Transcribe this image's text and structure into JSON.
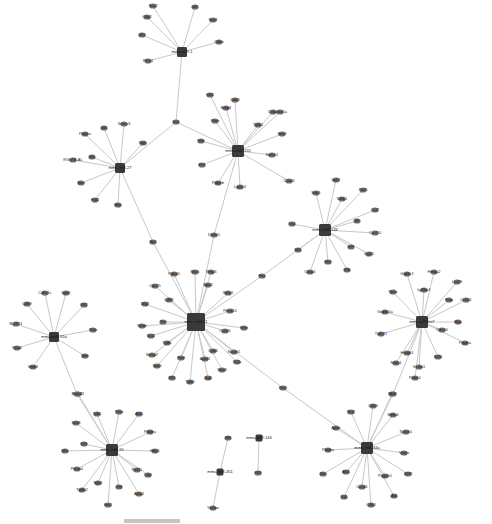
{
  "diagram": {
    "type": "gene-interaction-network",
    "hubs": [
      {
        "id": "h1",
        "label": "mmu-miR-1",
        "x": 182,
        "y": 52,
        "size": 10,
        "leaves": [
          {
            "label": "Sox2",
            "x": 153,
            "y": 6
          },
          {
            "label": "Id2",
            "x": 195,
            "y": 7
          },
          {
            "label": "Sox1",
            "x": 213,
            "y": 20
          },
          {
            "label": "Olig2",
            "x": 147,
            "y": 17
          },
          {
            "label": "Gli3",
            "x": 142,
            "y": 35
          },
          {
            "label": "Cdon",
            "x": 219,
            "y": 42
          },
          {
            "label": "Ptch1",
            "x": 148,
            "y": 61
          }
        ]
      },
      {
        "id": "h2",
        "label": "mmu-miR-27",
        "x": 120,
        "y": 168,
        "size": 10,
        "leaves": [
          {
            "label": "Pdgfra",
            "x": 85,
            "y": 134
          },
          {
            "label": "Id4",
            "x": 104,
            "y": 128
          },
          {
            "label": "Sema3",
            "x": 124,
            "y": 124
          },
          {
            "label": "Ngfr",
            "x": 143,
            "y": 143
          },
          {
            "label": "RG67B-AL",
            "x": 73,
            "y": 160
          },
          {
            "label": "Id1",
            "x": 92,
            "y": 157
          },
          {
            "label": "Nes",
            "x": 81,
            "y": 183
          },
          {
            "label": "Fgf2",
            "x": 95,
            "y": 200
          },
          {
            "label": "Myc",
            "x": 118,
            "y": 205
          }
        ]
      },
      {
        "id": "h3",
        "label": "mmu-miR-155",
        "x": 238,
        "y": 151,
        "size": 12,
        "leaves": [
          {
            "label": "Klf4",
            "x": 210,
            "y": 95
          },
          {
            "label": "Cd44",
            "x": 235,
            "y": 100
          },
          {
            "label": "Bmp4",
            "x": 226,
            "y": 108
          },
          {
            "label": "Cxcr4",
            "x": 273,
            "y": 112
          },
          {
            "label": "Cdkn1a",
            "x": 280,
            "y": 112
          },
          {
            "label": "Pten",
            "x": 215,
            "y": 121
          },
          {
            "label": "Tgfb1",
            "x": 258,
            "y": 125
          },
          {
            "label": "Sox9",
            "x": 282,
            "y": 134
          },
          {
            "label": "Vim",
            "x": 201,
            "y": 141
          },
          {
            "label": "Notch1",
            "x": 272,
            "y": 155
          },
          {
            "label": "Fn1",
            "x": 202,
            "y": 165
          },
          {
            "label": "Pdgfrb",
            "x": 218,
            "y": 183
          },
          {
            "label": "Lgals3",
            "x": 240,
            "y": 187
          },
          {
            "label": "Ccnd1",
            "x": 289,
            "y": 181
          }
        ]
      },
      {
        "id": "h4",
        "label": "mmu-miR-146",
        "x": 325,
        "y": 230,
        "size": 12,
        "leaves": [
          {
            "label": "Irak1",
            "x": 336,
            "y": 180
          },
          {
            "label": "Traf6",
            "x": 363,
            "y": 190
          },
          {
            "label": "Stat1",
            "x": 316,
            "y": 193
          },
          {
            "label": "Nfkb1",
            "x": 342,
            "y": 199
          },
          {
            "label": "Ccl2",
            "x": 375,
            "y": 210
          },
          {
            "label": "Il6",
            "x": 357,
            "y": 221
          },
          {
            "label": "Tlr4",
            "x": 292,
            "y": 224
          },
          {
            "label": "Cxcl10",
            "x": 375,
            "y": 233
          },
          {
            "label": "Ifit1",
            "x": 298,
            "y": 250
          },
          {
            "label": "Irf7",
            "x": 351,
            "y": 247
          },
          {
            "label": "Isg15",
            "x": 369,
            "y": 254
          },
          {
            "label": "Mx1",
            "x": 328,
            "y": 262
          },
          {
            "label": "Casp1",
            "x": 310,
            "y": 272
          },
          {
            "label": "Il1b",
            "x": 347,
            "y": 270
          }
        ]
      },
      {
        "id": "h5",
        "label": "mmu-miR-21",
        "x": 196,
        "y": 322,
        "size": 18,
        "leaves": [
          {
            "label": "Pdcd4",
            "x": 174,
            "y": 274
          },
          {
            "label": "Reck",
            "x": 195,
            "y": 272
          },
          {
            "label": "Timp3",
            "x": 211,
            "y": 272
          },
          {
            "label": "Sprr2",
            "x": 208,
            "y": 285
          },
          {
            "label": "Cdc25",
            "x": 155,
            "y": 286
          },
          {
            "label": "Spry1",
            "x": 228,
            "y": 293
          },
          {
            "label": "Cdh1",
            "x": 169,
            "y": 300
          },
          {
            "label": "Btg2",
            "x": 145,
            "y": 304
          },
          {
            "label": "Rhob",
            "x": 142,
            "y": 326
          },
          {
            "label": "Tnc",
            "x": 163,
            "y": 322
          },
          {
            "label": "Pdcd10",
            "x": 230,
            "y": 311
          },
          {
            "label": "Pten",
            "x": 244,
            "y": 328
          },
          {
            "label": "Ccnd1",
            "x": 225,
            "y": 331
          },
          {
            "label": "Bcl2",
            "x": 151,
            "y": 336
          },
          {
            "label": "Tgfbi",
            "x": 167,
            "y": 343
          },
          {
            "label": "Smad7",
            "x": 152,
            "y": 355
          },
          {
            "label": "Fasl",
            "x": 181,
            "y": 358
          },
          {
            "label": "Apaf1",
            "x": 205,
            "y": 359
          },
          {
            "label": "Cdk6",
            "x": 213,
            "y": 351
          },
          {
            "label": "Ncam1",
            "x": 234,
            "y": 352
          },
          {
            "label": "Il12a",
            "x": 237,
            "y": 362
          },
          {
            "label": "Sox5",
            "x": 157,
            "y": 366
          },
          {
            "label": "Klf5",
            "x": 172,
            "y": 378
          },
          {
            "label": "Tp63",
            "x": 190,
            "y": 382
          },
          {
            "label": "Jag1",
            "x": 208,
            "y": 378
          },
          {
            "label": "Stat3",
            "x": 222,
            "y": 370
          }
        ]
      },
      {
        "id": "h6",
        "label": "mmu-miR-let7",
        "x": 422,
        "y": 322,
        "size": 12,
        "leaves": [
          {
            "label": "Gabbr1",
            "x": 407,
            "y": 274
          },
          {
            "label": "Hmga2",
            "x": 434,
            "y": 272
          },
          {
            "label": "Lin28",
            "x": 457,
            "y": 282
          },
          {
            "label": "Igf2bp1",
            "x": 424,
            "y": 290
          },
          {
            "label": "Nras",
            "x": 393,
            "y": 292
          },
          {
            "label": "Kras",
            "x": 449,
            "y": 300
          },
          {
            "label": "Ccnd1",
            "x": 466,
            "y": 300
          },
          {
            "label": "Gabbr2a",
            "x": 385,
            "y": 312
          },
          {
            "label": "Myc",
            "x": 458,
            "y": 322
          },
          {
            "label": "Cdc34",
            "x": 442,
            "y": 330
          },
          {
            "label": "Pdgfra",
            "x": 465,
            "y": 343
          },
          {
            "label": "Trim71",
            "x": 381,
            "y": 334
          },
          {
            "label": "Hmgb1",
            "x": 407,
            "y": 353
          },
          {
            "label": "E2f5",
            "x": 438,
            "y": 357
          },
          {
            "label": "Nr6a1",
            "x": 396,
            "y": 363
          },
          {
            "label": "Vcam1",
            "x": 419,
            "y": 367
          },
          {
            "label": "Prdm1",
            "x": 415,
            "y": 378
          }
        ]
      },
      {
        "id": "h7",
        "label": "mmu-miR-92a",
        "x": 54,
        "y": 337,
        "size": 10,
        "leaves": [
          {
            "label": "Cdkn1c",
            "x": 45,
            "y": 293
          },
          {
            "label": "Itga5",
            "x": 66,
            "y": 293
          },
          {
            "label": "Cd69",
            "x": 27,
            "y": 304
          },
          {
            "label": "Klf2",
            "x": 84,
            "y": 305
          },
          {
            "label": "Bcl2l11",
            "x": 16,
            "y": 324
          },
          {
            "label": "Pten",
            "x": 93,
            "y": 330
          },
          {
            "label": "Nox4",
            "x": 17,
            "y": 348
          },
          {
            "label": "Bim",
            "x": 85,
            "y": 356
          },
          {
            "label": "Mob3",
            "x": 33,
            "y": 367
          }
        ]
      },
      {
        "id": "h8",
        "label": "mmu-miR-19",
        "x": 112,
        "y": 450,
        "size": 12,
        "leaves": [
          {
            "label": "Rab23",
            "x": 78,
            "y": 394
          },
          {
            "label": "Tab1",
            "x": 97,
            "y": 414
          },
          {
            "label": "Pten",
            "x": 119,
            "y": 412
          },
          {
            "label": "Akt1",
            "x": 139,
            "y": 414
          },
          {
            "label": "Sox8",
            "x": 76,
            "y": 423
          },
          {
            "label": "Pdgfra",
            "x": 150,
            "y": 432
          },
          {
            "label": "Kif1",
            "x": 84,
            "y": 444
          },
          {
            "label": "Nfia",
            "x": 65,
            "y": 451
          },
          {
            "label": "Hbp1",
            "x": 155,
            "y": 451
          },
          {
            "label": "Prkaa1",
            "x": 77,
            "y": 469
          },
          {
            "label": "Rnf11",
            "x": 137,
            "y": 470
          },
          {
            "label": "Ctgf",
            "x": 148,
            "y": 475
          },
          {
            "label": "Tgfbr2",
            "x": 82,
            "y": 490
          },
          {
            "label": "Sgk1",
            "x": 98,
            "y": 483
          },
          {
            "label": "Tnf",
            "x": 119,
            "y": 487
          },
          {
            "label": "Atxn1",
            "x": 139,
            "y": 494
          },
          {
            "label": "Esr1",
            "x": 108,
            "y": 505
          }
        ]
      },
      {
        "id": "h9",
        "label": "mmu-miR-34a",
        "x": 367,
        "y": 448,
        "size": 12,
        "leaves": [
          {
            "label": "Sirt1",
            "x": 392,
            "y": 394
          },
          {
            "label": "Cd44",
            "x": 373,
            "y": 406
          },
          {
            "label": "Bcl2",
            "x": 351,
            "y": 412
          },
          {
            "label": "Mdm4",
            "x": 393,
            "y": 415
          },
          {
            "label": "Apoe",
            "x": 336,
            "y": 428
          },
          {
            "label": "Notch1",
            "x": 406,
            "y": 432
          },
          {
            "label": "Pdgfra",
            "x": 328,
            "y": 450
          },
          {
            "label": "Vegfa",
            "x": 404,
            "y": 453
          },
          {
            "label": "Met",
            "x": 323,
            "y": 474
          },
          {
            "label": "Akt1",
            "x": 346,
            "y": 472
          },
          {
            "label": "Pdgfrb1",
            "x": 385,
            "y": 476
          },
          {
            "label": "E2f3",
            "x": 408,
            "y": 474
          },
          {
            "label": "Ccnd1",
            "x": 362,
            "y": 487
          },
          {
            "label": "Yy1",
            "x": 344,
            "y": 497
          },
          {
            "label": "Axl",
            "x": 394,
            "y": 496
          },
          {
            "label": "Cdk4",
            "x": 371,
            "y": 505
          }
        ]
      },
      {
        "id": "h10",
        "label": "mmu-miR-451",
        "x": 220,
        "y": 472,
        "size": 7,
        "leaves": [
          {
            "label": "Mif",
            "x": 228,
            "y": 438
          },
          {
            "label": "Ywhaz",
            "x": 213,
            "y": 508
          }
        ]
      },
      {
        "id": "h11",
        "label": "mmu-miR-144",
        "x": 259,
        "y": 438,
        "size": 7,
        "leaves": [
          {
            "label": "Klf3",
            "x": 258,
            "y": 473
          }
        ]
      }
    ],
    "bridges": [
      {
        "label": "Irs1",
        "x": 176,
        "y": 122,
        "links": [
          "h1",
          "h2",
          "h3"
        ]
      },
      {
        "label": "Sp1",
        "x": 153,
        "y": 242,
        "links": [
          "h2",
          "h5"
        ]
      },
      {
        "label": "Dnmt1",
        "x": 214,
        "y": 235,
        "links": [
          "h3",
          "h5"
        ]
      },
      {
        "label": "Fos",
        "x": 262,
        "y": 276,
        "links": [
          "h4",
          "h5"
        ]
      },
      {
        "label": "Ets1",
        "x": 283,
        "y": 388,
        "links": [
          "h5",
          "h9"
        ]
      },
      {
        "label": "Gata1",
        "x": 77,
        "y": 394,
        "links": [
          "h7",
          "h8"
        ]
      },
      {
        "label": "Atf2",
        "x": 393,
        "y": 394,
        "links": [
          "h6",
          "h9"
        ]
      }
    ]
  },
  "scrollbar": {
    "visible": true
  }
}
